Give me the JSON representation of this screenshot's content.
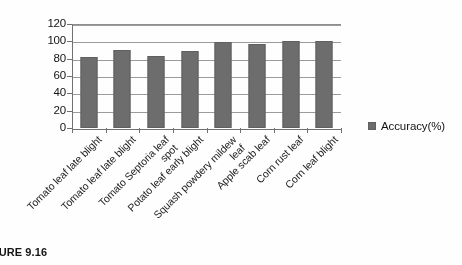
{
  "chart_data": {
    "type": "bar",
    "title": "",
    "xlabel": "",
    "ylabel": "",
    "ylim": [
      0,
      120
    ],
    "yticks": [
      0,
      20,
      40,
      60,
      80,
      100,
      120
    ],
    "grid": true,
    "legend_position": "right",
    "bar_color": "#6b6b6b",
    "categories": [
      "Tomato leaf late blight",
      "Tomato leaf late blight",
      "Tomato Septoria leaf spot",
      "Potato leaf early blight",
      "Squash powdery mildew leaf",
      "Apple scab leaf",
      "Corn rust leaf",
      "Corn leaf blight"
    ],
    "category_lines": [
      [
        "Tomato leaf late blight"
      ],
      [
        "Tomato leaf late blight"
      ],
      [
        "Tomato Septoria leaf",
        "spot"
      ],
      [
        "Potato leaf early blight"
      ],
      [
        "Squash powdery mildew",
        "leaf"
      ],
      [
        "Apple scab leaf"
      ],
      [
        "Corn rust leaf"
      ],
      [
        "Corn leaf blight"
      ]
    ],
    "series": [
      {
        "name": "Accuracy(%)",
        "values": [
          82,
          90,
          83,
          89,
          99,
          97,
          100,
          100
        ]
      }
    ]
  },
  "axis": {
    "y_tick_labels": [
      "120",
      "100",
      "80",
      "60",
      "40",
      "20",
      "0"
    ]
  },
  "legend": {
    "entries": [
      {
        "label": "Accuracy(%)",
        "color": "#6b6b6b"
      }
    ]
  },
  "caption": {
    "text": "FIGURE 9.16"
  }
}
